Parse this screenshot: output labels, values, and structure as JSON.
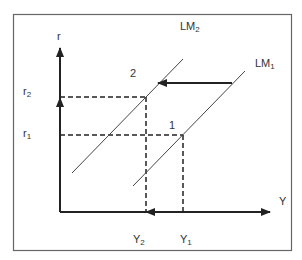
{
  "diagram": {
    "type": "IS-LM shift diagram (LM curve shift)",
    "axes": {
      "y_label": "r",
      "x_label": "Y"
    },
    "curves": [
      {
        "name": "LM1",
        "label_main": "LM",
        "label_sub": "1"
      },
      {
        "name": "LM2",
        "label_main": "LM",
        "label_sub": "2"
      }
    ],
    "points": [
      {
        "id": "1",
        "label": "1",
        "r": "r1",
        "Y": "Y1"
      },
      {
        "id": "2",
        "label": "2",
        "r": "r2",
        "Y": "Y2"
      }
    ],
    "ticks": {
      "r2": {
        "main": "r",
        "sub": "2"
      },
      "r1": {
        "main": "r",
        "sub": "1"
      },
      "Y2": {
        "main": "Y",
        "sub": "2"
      },
      "Y1": {
        "main": "Y",
        "sub": "1"
      }
    },
    "arrows": [
      {
        "name": "lm-shift-arrow",
        "direction": "left",
        "from": "LM1",
        "to": "LM2"
      },
      {
        "name": "r-increase-arrow",
        "direction": "up",
        "from": "r1",
        "to": "r2"
      },
      {
        "name": "y-decrease-arrow",
        "direction": "left",
        "from": "Y1",
        "to": "Y2"
      }
    ],
    "colors": {
      "line": "#333333",
      "frame": "#555555"
    }
  }
}
